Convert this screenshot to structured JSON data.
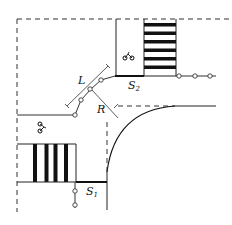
{
  "diagram": {
    "type": "intersection-corner-layout",
    "labels": {
      "length": "L",
      "radius": "R",
      "stop_line_1": "S",
      "stop_line_1_sub": "1",
      "stop_line_2": "S",
      "stop_line_2_sub": "2"
    },
    "icons": {
      "bicycle_top": "bicycle-icon",
      "bicycle_left": "bicycle-icon"
    },
    "colors": {
      "line": "#111111",
      "background": "#ffffff"
    }
  }
}
